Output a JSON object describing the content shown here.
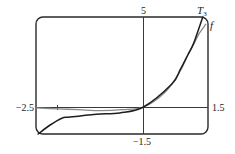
{
  "chart_data": {
    "type": "line",
    "title": "",
    "xlabel": "",
    "ylabel": "",
    "xlim": [
      -2.5,
      1.5
    ],
    "ylim": [
      -1.5,
      5
    ],
    "grid": false,
    "legend_position": "inline labels at upper right",
    "tick_labels": {
      "x_min": "−2.5",
      "x_max": "1.5",
      "y_min": "−1.5",
      "y_max": "5"
    },
    "x_ticks": [
      -2
    ],
    "series": [
      {
        "name": "f",
        "style": "light",
        "x": [
          -2.5,
          -2.0,
          -1.5,
          -1.0,
          -0.5,
          0.0,
          0.5,
          0.85,
          1.03,
          1.17,
          1.3,
          1.45
        ],
        "y": [
          -0.05,
          -0.1,
          -0.15,
          -0.2,
          -0.15,
          0.0,
          0.82,
          1.99,
          2.89,
          3.5,
          4.1,
          4.6
        ]
      },
      {
        "name": "T3",
        "style": "dark",
        "x": [
          -2.45,
          -2.17,
          -1.9,
          -1.71,
          -1.1,
          -0.55,
          0.0,
          0.66,
          0.85,
          1.03,
          1.17,
          1.38
        ],
        "y": [
          -1.5,
          -1.0,
          -0.62,
          -0.56,
          -0.4,
          -0.33,
          0.0,
          1.28,
          2.06,
          2.89,
          3.56,
          5.0
        ]
      }
    ],
    "annotations": [
      {
        "text": "T",
        "subscript": "3",
        "near": "top-right, end of T3 curve"
      },
      {
        "text": "f",
        "near": "right edge, end of f curve"
      }
    ]
  },
  "labels": {
    "y_top": "5",
    "y_bottom": "−1.5",
    "x_left": "−2.5",
    "x_right": "1.5",
    "t3_main": "T",
    "t3_sub": "3",
    "f_label": "f"
  },
  "colors": {
    "frame": "#2a2a2a",
    "axes": "#3a3a3a",
    "f_curve": "#8a8a8a",
    "t3_curve": "#1e1e1e"
  }
}
